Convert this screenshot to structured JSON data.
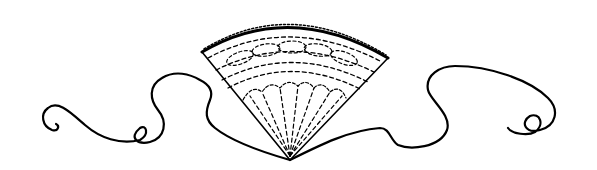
{
  "illustration": {
    "subject": "Hand fan with flowing ribbons",
    "style": "black line art on white",
    "colors": {
      "ink": "#000000",
      "background": "#ffffff"
    },
    "elements": [
      "folding-fan",
      "left-ribbon",
      "right-ribbon"
    ]
  }
}
